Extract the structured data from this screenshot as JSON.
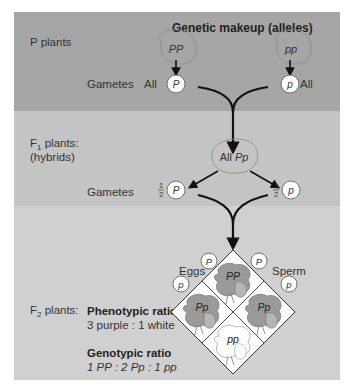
{
  "header": {
    "title": "Genetic makeup (alleles)"
  },
  "generations": {
    "p": {
      "label": "P plants",
      "parent_left": "PP",
      "parent_right": "pp",
      "gametes_label": "Gametes",
      "gamete_left": {
        "prefix": "All",
        "allele": "P"
      },
      "gamete_right": {
        "suffix": "All",
        "allele": "p"
      }
    },
    "f1": {
      "label_main": "F",
      "label_sub": "1",
      "label_rest": " plants:",
      "label_line2": "(hybrids)",
      "genotype_prefix": "All ",
      "genotype": "Pp",
      "gametes_label": "Gametes",
      "gamete_left": {
        "fraction_num": "1",
        "fraction_den": "2",
        "allele": "P"
      },
      "gamete_right": {
        "fraction_num": "1",
        "fraction_den": "2",
        "allele": "p"
      }
    },
    "f2": {
      "label_main": "F",
      "label_sub": "2",
      "label_rest": " plants:",
      "eggs_label": "Eggs",
      "sperm_label": "Sperm",
      "eggs": [
        "P",
        "p"
      ],
      "sperm": [
        "P",
        "p"
      ],
      "punnett": {
        "top": "PP",
        "left": "Pp",
        "right": "Pp",
        "bottom": "pp"
      },
      "phenotypic_title": "Phenotypic ratio",
      "phenotypic_value": "3 purple : 1 white",
      "genotypic_title": "Genotypic ratio",
      "genotypic_value": "1 PP : 2 Pp : 1 pp"
    }
  },
  "colors": {
    "band_p": "#a6a6a6",
    "band_f1": "#c4c4c4",
    "band_f2": "#d0d0d0",
    "flower_purple": "#9a9a9a",
    "flower_white": "#ffffff",
    "arrow": "#111111"
  }
}
